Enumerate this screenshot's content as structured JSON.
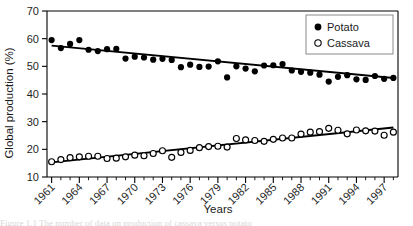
{
  "figure": {
    "background_color": "#ffffff",
    "foreground_color": "#000000"
  },
  "chart_data": {
    "type": "scatter",
    "title": "",
    "xlabel": "Years",
    "ylabel": "Global production (%)",
    "xlim": [
      1960.5,
      1998.5
    ],
    "ylim": [
      10,
      70
    ],
    "ytick_labels": [
      "10",
      "20",
      "30",
      "40",
      "50",
      "60",
      "70"
    ],
    "ytick_values": [
      10,
      20,
      30,
      40,
      50,
      60,
      70
    ],
    "xtick_labels": [
      "1961",
      "1964",
      "1967",
      "1970",
      "1973",
      "1976",
      "1979",
      "1982",
      "1985",
      "1988",
      "1991",
      "1994",
      "1997"
    ],
    "xtick_values": [
      1961,
      1964,
      1967,
      1970,
      1973,
      1976,
      1979,
      1982,
      1985,
      1988,
      1991,
      1994,
      1997
    ],
    "minor_ticks_every": 1,
    "grid": false,
    "legend_position": "top-right",
    "series": [
      {
        "name": "Potato",
        "marker": "filled-circle",
        "color": "#000000",
        "x": [
          1961,
          1962,
          1963,
          1964,
          1965,
          1966,
          1967,
          1968,
          1969,
          1970,
          1971,
          1972,
          1973,
          1974,
          1975,
          1976,
          1977,
          1978,
          1979,
          1980,
          1981,
          1982,
          1983,
          1984,
          1985,
          1986,
          1987,
          1988,
          1989,
          1990,
          1991,
          1992,
          1993,
          1994,
          1995,
          1996,
          1997,
          1998
        ],
        "values": [
          59.5,
          56.6,
          58.1,
          59.5,
          56.0,
          55.5,
          56.2,
          56.3,
          52.8,
          53.5,
          53.2,
          52.4,
          52.7,
          52.3,
          49.7,
          50.6,
          49.8,
          49.9,
          51.8,
          46.0,
          50.0,
          49.2,
          48.2,
          50.3,
          50.4,
          50.8,
          48.5,
          48.0,
          47.7,
          47.0,
          44.5,
          46.2,
          46.8,
          45.3,
          45.1,
          46.5,
          45.5,
          45.8
        ],
        "trend": {
          "x_start": 1961,
          "y_start": 57.5,
          "x_end": 1998,
          "y_end": 45.8
        }
      },
      {
        "name": "Cassava",
        "marker": "open-circle",
        "color": "#000000",
        "x": [
          1961,
          1962,
          1963,
          1964,
          1965,
          1966,
          1967,
          1968,
          1969,
          1970,
          1971,
          1972,
          1973,
          1974,
          1975,
          1976,
          1977,
          1978,
          1979,
          1980,
          1981,
          1982,
          1983,
          1984,
          1985,
          1986,
          1987,
          1988,
          1989,
          1990,
          1991,
          1992,
          1993,
          1994,
          1995,
          1996,
          1997,
          1998
        ],
        "values": [
          15.5,
          16.3,
          17.0,
          17.3,
          17.5,
          17.5,
          16.7,
          16.8,
          17.3,
          17.9,
          17.7,
          18.5,
          19.5,
          17.1,
          18.9,
          19.6,
          20.6,
          21.0,
          21.1,
          20.8,
          23.9,
          23.4,
          23.2,
          22.9,
          23.6,
          24.1,
          24.1,
          25.5,
          26.2,
          26.4,
          27.6,
          26.9,
          25.6,
          27.0,
          26.7,
          26.6,
          25.1,
          26.2
        ],
        "trend": {
          "x_start": 1961,
          "y_start": 15.3,
          "x_end": 1998,
          "y_end": 27.9
        }
      }
    ]
  },
  "legend": {
    "items": [
      {
        "label": "Potato",
        "marker": "filled-circle"
      },
      {
        "label": "Cassava",
        "marker": "open-circle"
      }
    ]
  },
  "caption": {
    "text": "Figure 1.1    The number of data on production of cassava versus potato"
  }
}
